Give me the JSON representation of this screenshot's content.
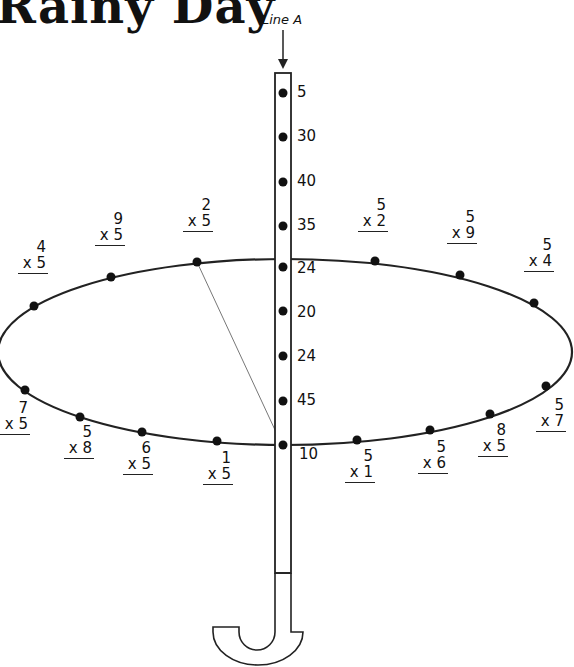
{
  "title": "Rainy Day",
  "line_label": "Line A",
  "shaft_numbers": [
    {
      "label": "5",
      "x": 297,
      "y": 85
    },
    {
      "label": "30",
      "x": 297,
      "y": 129
    },
    {
      "label": "40",
      "x": 297,
      "y": 174
    },
    {
      "label": "35",
      "x": 297,
      "y": 218
    },
    {
      "label": "24",
      "x": 297,
      "y": 261
    },
    {
      "label": "20",
      "x": 297,
      "y": 305
    },
    {
      "label": "24",
      "x": 297,
      "y": 349
    },
    {
      "label": "45",
      "x": 297,
      "y": 393
    },
    {
      "label": "10",
      "x": 299,
      "y": 447
    }
  ],
  "problems": [
    {
      "top": "4",
      "bottom": "x 5",
      "x": 18,
      "y": 240
    },
    {
      "top": "9",
      "bottom": "x 5",
      "x": 95,
      "y": 212
    },
    {
      "top": "2",
      "bottom": "x 5",
      "x": 183,
      "y": 198
    },
    {
      "top": "5",
      "bottom": "x 2",
      "x": 358,
      "y": 198
    },
    {
      "top": "5",
      "bottom": "x 9",
      "x": 447,
      "y": 210
    },
    {
      "top": "5",
      "bottom": "x 4",
      "x": 524,
      "y": 238
    },
    {
      "top": "7",
      "bottom": "x 5",
      "x": 0,
      "y": 401
    },
    {
      "top": "5",
      "bottom": "x 8",
      "x": 64,
      "y": 425
    },
    {
      "top": "6",
      "bottom": "x 5",
      "x": 123,
      "y": 441
    },
    {
      "top": "1",
      "bottom": "x 5",
      "x": 203,
      "y": 451
    },
    {
      "top": "5",
      "bottom": "x 1",
      "x": 345,
      "y": 449
    },
    {
      "top": "5",
      "bottom": "x 6",
      "x": 418,
      "y": 440
    },
    {
      "top": "8",
      "bottom": "x 5",
      "x": 478,
      "y": 423
    },
    {
      "top": "5",
      "bottom": "x 7",
      "x": 536,
      "y": 398
    }
  ]
}
